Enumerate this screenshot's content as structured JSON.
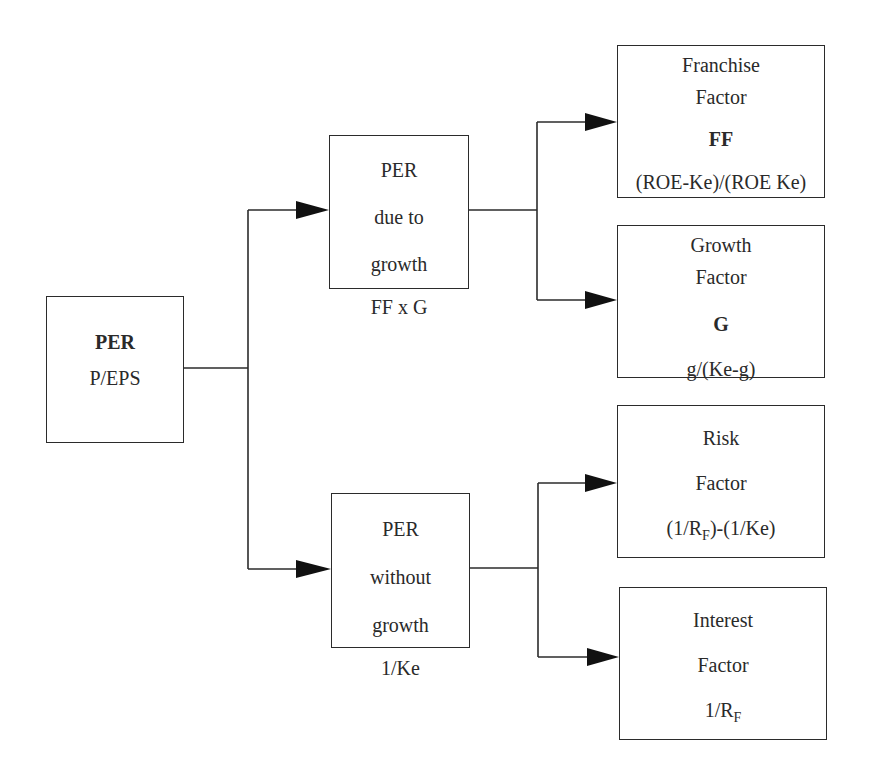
{
  "diagram": {
    "root": {
      "symbol": "PER",
      "formula": "P/EPS"
    },
    "branches": [
      {
        "title_lines": [
          "PER",
          "due to",
          "growth"
        ],
        "formula": "FF x G",
        "children": [
          {
            "title_lines": [
              "Franchise",
              "Factor"
            ],
            "symbol": "FF",
            "formula": "(ROE-Ke)/(ROE Ke)"
          },
          {
            "title_lines": [
              "Growth",
              "Factor"
            ],
            "symbol": "G",
            "formula": "g/(Ke-g)"
          }
        ]
      },
      {
        "title_lines": [
          "PER",
          "without",
          "growth"
        ],
        "formula": "1/Ke",
        "children": [
          {
            "title_lines": [
              "Risk",
              "Factor"
            ],
            "formula_parts": [
              "(1/R",
              "F",
              ")-(1/Ke)"
            ]
          },
          {
            "title_lines": [
              "Interest",
              "Factor"
            ],
            "formula_parts": [
              "1/R",
              "F",
              ""
            ]
          }
        ]
      }
    ]
  },
  "colors": {
    "stroke": "#2b2b2b",
    "text": "#2a2a2a",
    "background": "#ffffff"
  }
}
